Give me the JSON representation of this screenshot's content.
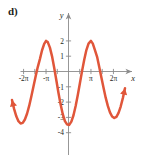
{
  "figure": {
    "part_label": "d)"
  },
  "chart_data": {
    "type": "line",
    "title": "",
    "subtitle": "",
    "xlabel": "x",
    "ylabel": "y",
    "xlim": [
      -7.9,
      7.9
    ],
    "ylim": [
      -4.6,
      2.6
    ],
    "grid": false,
    "legend": null,
    "curve_color": "#e0563a",
    "axis_color": "#8b8b8b",
    "background_color": "#ffffff",
    "function": "y = 3cos(x + pi) - 1",
    "amplitude": 3,
    "midline": -1,
    "period": 6.283185,
    "maximum": {
      "x": -3.141593,
      "y": 2
    },
    "minimum": {
      "x": 3.141593,
      "y": -4
    },
    "arrowheads": [
      "lower-left",
      "upper-right"
    ],
    "x_ticks": [
      -6.283185,
      -4.712389,
      -3.141593,
      -1.570796,
      1.570796,
      3.141593,
      4.712389,
      6.283185
    ],
    "x_tick_labels": [
      {
        "x": -6.283185,
        "label": "-2π"
      },
      {
        "x": -3.141593,
        "label": "-π"
      },
      {
        "x": 3.141593,
        "label": "π"
      },
      {
        "x": 6.283185,
        "label": "2π"
      }
    ],
    "y_ticks": [
      -4,
      -3,
      -2,
      -1,
      1,
      2
    ],
    "y_tick_labels": [
      {
        "y": 2,
        "label": "2"
      },
      {
        "y": 1,
        "label": "1"
      },
      {
        "y": -1,
        "label": "-1"
      },
      {
        "y": -2,
        "label": "-2"
      },
      {
        "y": -3,
        "label": "-3"
      },
      {
        "y": -4,
        "label": "-4"
      }
    ],
    "x": [
      -7.9,
      -7.6,
      -7.3,
      -7.0,
      -6.7,
      -6.4,
      -6.1,
      -5.8,
      -5.5,
      -5.2,
      -4.9,
      -4.6,
      -4.3,
      -4.0,
      -3.7,
      -3.4,
      -3.14,
      -2.9,
      -2.6,
      -2.3,
      -2.0,
      -1.7,
      -1.4,
      -1.1,
      -0.8,
      -0.5,
      -0.2,
      0.1,
      0.4,
      0.7,
      1.0,
      1.3,
      1.6,
      1.9,
      2.2,
      2.5,
      2.8,
      3.14,
      3.4,
      3.7,
      4.0,
      4.3,
      4.6,
      4.9,
      5.2,
      5.5,
      5.8,
      6.1,
      6.4,
      6.7,
      7.0,
      7.3,
      7.6,
      7.9
    ],
    "y": [
      -1.86,
      -2.46,
      -2.93,
      -3.25,
      -3.4,
      -3.36,
      -3.14,
      -2.76,
      -2.25,
      -1.64,
      -0.98,
      -0.32,
      0.29,
      0.81,
      1.39,
      1.8,
      2.0,
      1.92,
      1.56,
      0.99,
      0.25,
      -0.57,
      -1.4,
      -2.16,
      -2.79,
      -3.24,
      -3.46,
      -3.49,
      -3.28,
      -2.86,
      -2.26,
      -1.54,
      -0.75,
      0.04,
      0.77,
      1.4,
      1.82,
      2.0,
      1.82,
      1.4,
      0.96,
      0.3,
      -0.39,
      -1.07,
      -1.71,
      -2.25,
      -2.67,
      -2.94,
      -3.04,
      -2.96,
      -2.7,
      -2.29,
      -1.74,
      -1.09
    ]
  }
}
